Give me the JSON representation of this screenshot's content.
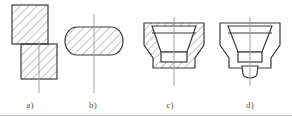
{
  "figure": {
    "background_color": "#ffffff",
    "line_color": "#3a3a3a",
    "hatch_color": "#8a8a8a",
    "centerline_color": "#9a9a9a",
    "caption_color": "#555555",
    "width_px": 292,
    "height_px": 116,
    "panel_count": 4
  },
  "captions": {
    "a": "a)",
    "b": "b)",
    "c": "c)",
    "d": "d)"
  },
  "panels": [
    {
      "id": "a",
      "label": "a)",
      "description": "Two offset hatched rectangular blocks in section, upper block shifted left over lower block, vertical centerline through lower block",
      "hatched": true,
      "centerline": true,
      "shapes": [
        {
          "kind": "rectangle",
          "name": "upper-block",
          "hatch": true
        },
        {
          "kind": "rectangle",
          "name": "lower-block",
          "hatch": true
        }
      ]
    },
    {
      "id": "b",
      "label": "b)",
      "description": "Capsule / stadium shaped billet in section with uniform hatching and a vertical centerline passing through",
      "hatched": true,
      "centerline": true,
      "shapes": [
        {
          "kind": "stadium",
          "name": "billet-body",
          "hatch": true
        }
      ]
    },
    {
      "id": "c",
      "label": "c)",
      "description": "Sectioned die body, funnel shaped tapered cavity, hatched walls on both sides, rectangular punch seat at bottom",
      "hatched": true,
      "centerline": true,
      "shapes": [
        {
          "kind": "die-body",
          "name": "die-outer-wall",
          "hatch": true
        },
        {
          "kind": "cavity",
          "name": "tapered-cavity",
          "hatch": false
        },
        {
          "kind": "rectangle",
          "name": "bottom-seat",
          "hatch": false
        }
      ]
    },
    {
      "id": "d",
      "label": "d)",
      "description": "Outline view of formed part, funnel shaped body with stepped neck and small rounded bottom stub, no hatching",
      "hatched": false,
      "centerline": true,
      "shapes": [
        {
          "kind": "funnel-outline",
          "name": "part-body",
          "hatch": false
        },
        {
          "kind": "neck",
          "name": "stepped-neck",
          "hatch": false
        },
        {
          "kind": "stub",
          "name": "rounded-stub",
          "hatch": false
        }
      ]
    }
  ]
}
